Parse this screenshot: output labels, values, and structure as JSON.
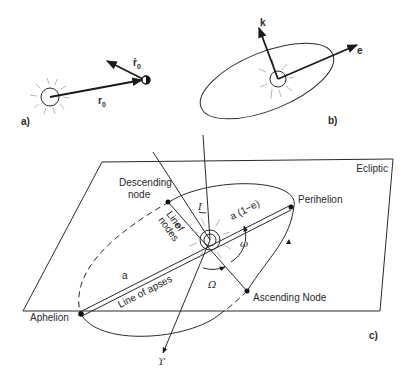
{
  "panels": {
    "a": {
      "label": "a)",
      "position_vector": "r",
      "position_subscript": "0",
      "velocity_vector": "ṙ",
      "velocity_subscript": "0"
    },
    "b": {
      "label": "b)",
      "normal_vector": "k",
      "eccentricity_vector": "e"
    },
    "c": {
      "label": "c)",
      "plane_label": "Ecliptic",
      "descending_node": [
        "Descending",
        "node"
      ],
      "ascending_node": "Ascending Node",
      "perihelion": "Perihelion",
      "aphelion": "Aphelion",
      "line_of_nodes": [
        "Line",
        "of",
        "nodes"
      ],
      "line_of_apses": "Line of apses",
      "semi_major_axis": "a",
      "perihelion_distance": "a (1−e)",
      "inclination": "I",
      "arg_perihelion": "ω",
      "long_ascending_node": "Ω",
      "vernal_equinox": "ϒ"
    }
  }
}
